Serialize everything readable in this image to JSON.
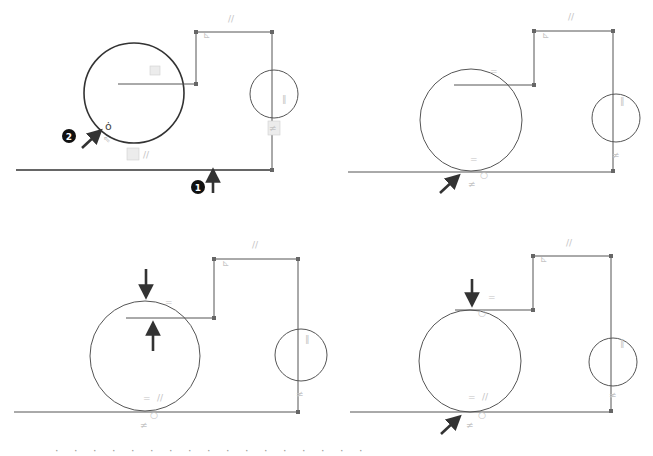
{
  "figure": {
    "panels": [
      {
        "id": "top-left",
        "callouts": [
          "1",
          "2"
        ],
        "cursor_glyph": "ȯ"
      },
      {
        "id": "top-right"
      },
      {
        "id": "bottom-left"
      },
      {
        "id": "bottom-right"
      }
    ],
    "constraint_glyphs": {
      "parallel": "//",
      "equal": "=",
      "perpendicular": "⊥",
      "tangent": "ȯ",
      "vertical": "‖",
      "coincident": "≠"
    },
    "callout_1": "1",
    "callout_2": "2",
    "caption_partial": "· · · · · · · · · · · · · · · · ·"
  },
  "colors": {
    "geometry": "#555555",
    "arrows": "#333333",
    "constraint_glyphs": "#c4c4c4",
    "background": "#ffffff"
  }
}
